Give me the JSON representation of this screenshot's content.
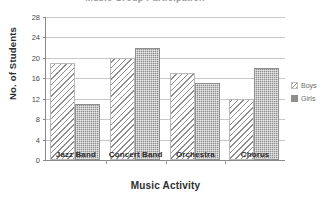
{
  "chart_data": {
    "type": "bar",
    "title": "Music Group Participation",
    "xlabel": "Music Activity",
    "ylabel": "No. of Students",
    "categories": [
      "Jazz Band",
      "Concert Band",
      "Orchestra",
      "Chorus"
    ],
    "series": [
      {
        "name": "Boys",
        "values": [
          19,
          20,
          17,
          12
        ],
        "pattern": "diagonal-hatch",
        "color": "#8d8d8d"
      },
      {
        "name": "Girls",
        "values": [
          11,
          22,
          15,
          18
        ],
        "pattern": "stipple-fill",
        "color": "#8e8e8e"
      }
    ],
    "ylim": [
      0,
      28
    ],
    "yticks": [
      0,
      4,
      8,
      12,
      16,
      20,
      24,
      28
    ],
    "ytick_labels": [
      "0",
      "4",
      "8",
      "12",
      "16",
      "20",
      "24",
      "28"
    ],
    "grid": true,
    "grid_axis": "y",
    "legend_position": "right",
    "bar_mode": "grouped"
  },
  "legend": {
    "entries": [
      {
        "label": "Boys"
      },
      {
        "label": "Girls"
      }
    ]
  }
}
